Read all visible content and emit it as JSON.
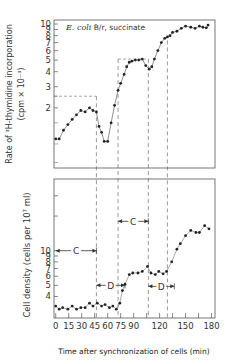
{
  "chart_data": [
    {
      "type": "line",
      "title": "",
      "annotation": "E. coli B/r, succinate",
      "annotation_italic": "E. coli",
      "annotation_rest": " B/r, succinate",
      "xlabel": "",
      "ylabel_line1": "Rate of ³H-thymidine incorporation",
      "ylabel_line2": "(cpm × 10⁻³)",
      "yscale": "log",
      "ylim": [
        0.63,
        10.8
      ],
      "xlim": [
        -2,
        184
      ],
      "yticks": [
        2,
        3,
        4,
        5,
        6,
        7,
        8,
        9,
        10
      ],
      "ytick_labels": [
        "2",
        "3",
        "4",
        "5",
        "6",
        "7",
        "8",
        "9",
        "10"
      ],
      "extra_minor_ticks": [
        0.7,
        1.0,
        1.5,
        2.5
      ],
      "series": [
        {
          "name": "rate",
          "x": [
            0,
            4,
            9,
            14,
            19,
            24,
            29,
            34,
            39,
            43,
            47,
            50,
            53,
            56,
            60,
            64,
            68,
            72,
            75,
            79,
            82,
            85,
            88,
            92,
            96,
            100,
            104,
            108,
            111,
            114,
            118,
            122,
            126,
            129,
            132,
            135,
            140,
            145,
            150,
            156,
            161,
            166,
            170,
            174,
            176
          ],
          "values": [
            1.1,
            1.1,
            1.3,
            1.45,
            1.6,
            1.75,
            1.9,
            1.85,
            2.0,
            1.9,
            1.85,
            1.4,
            1.25,
            1.05,
            1.05,
            1.5,
            2.1,
            2.8,
            3.2,
            3.8,
            4.4,
            4.8,
            4.9,
            5.0,
            5.0,
            5.1,
            4.5,
            4.2,
            4.4,
            5.1,
            6.0,
            7.0,
            7.6,
            7.8,
            8.0,
            8.5,
            8.7,
            9.2,
            9.6,
            9.4,
            9.2,
            9.6,
            9.4,
            9.3,
            9.8
          ]
        }
      ],
      "dashed_boxes": [
        {
          "x_from": -2,
          "x_to": 47,
          "y": 2.5
        },
        {
          "x_from": 72,
          "x_to": 107,
          "y": 5.1
        }
      ]
    },
    {
      "type": "scatter",
      "title": "",
      "xlabel": "Time after synchronization of cells (min)",
      "ylabel": "Cell density (cells per 10⁷ ml)",
      "yscale": "log",
      "ylim": [
        2.6,
        42
      ],
      "xlim": [
        -2,
        184
      ],
      "yticks": [
        4,
        5,
        6,
        7,
        8,
        9,
        10
      ],
      "ytick_labels": [
        "4",
        "5",
        "6",
        "7",
        "8",
        "9",
        "10"
      ],
      "xticks": [
        0,
        15,
        30,
        45,
        60,
        75,
        90,
        120,
        150,
        180
      ],
      "xtick_labels": [
        "0",
        "15",
        "30",
        "45",
        "60",
        "75",
        "90",
        "120",
        "150",
        "180"
      ],
      "series": [
        {
          "name": "cell density",
          "x": [
            0,
            4,
            8,
            14,
            19,
            24,
            29,
            34,
            39,
            43,
            48,
            53,
            57,
            62,
            66,
            70,
            74,
            77,
            80,
            85,
            89,
            95,
            100,
            106,
            110,
            115,
            119,
            124,
            128,
            134,
            140,
            144,
            150,
            156,
            162,
            166,
            172,
            177
          ],
          "values": [
            3.3,
            3.1,
            3.2,
            3.1,
            3.3,
            3.1,
            3.2,
            3.2,
            3.5,
            3.3,
            3.5,
            3.3,
            3.4,
            3.2,
            3.3,
            3.1,
            3.5,
            4.5,
            5.1,
            6.2,
            6.4,
            6.4,
            6.6,
            7.3,
            6.4,
            6.2,
            6.6,
            6.3,
            6.6,
            8.0,
            10.3,
            11.5,
            13.5,
            15.0,
            14.4,
            14.4,
            16.5,
            15.5
          ]
        }
      ],
      "dashed_verticals_min": [
        47,
        72,
        107,
        129
      ],
      "interval_markers": [
        {
          "label": "C",
          "x_from": 0,
          "x_to": 47,
          "y": 10
        },
        {
          "label": "D",
          "x_from": 47,
          "x_to": 80,
          "y": 5
        },
        {
          "label": "C",
          "x_from": 72,
          "x_to": 107,
          "y": 18
        },
        {
          "label": "D",
          "x_from": 107,
          "x_to": 137,
          "y": 4.9
        }
      ]
    }
  ]
}
